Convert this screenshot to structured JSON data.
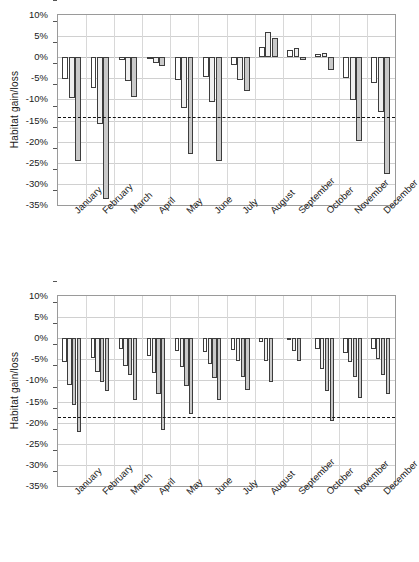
{
  "figure": {
    "panels": [
      "top",
      "bottom"
    ]
  },
  "chart_data": [
    {
      "type": "bar",
      "panel": "top",
      "title": "",
      "xlabel": "",
      "ylabel": "Habitat gain/loss",
      "ylim": [
        -35,
        10
      ],
      "ytick_labels": [
        "10%",
        "5%",
        "0%",
        "-5%",
        "-10%",
        "-15%",
        "-20%",
        "-25%",
        "-30%",
        "-35%"
      ],
      "ytick_values": [
        10,
        5,
        0,
        -5,
        -10,
        -15,
        -20,
        -25,
        -30,
        -35
      ],
      "grid": true,
      "legend": "none",
      "categories": [
        "January",
        "February",
        "March",
        "April",
        "May",
        "June",
        "July",
        "August",
        "September",
        "October",
        "November",
        "December"
      ],
      "series": [
        {
          "name": "series-1",
          "fill": "#ffffff",
          "values": [
            -5.1,
            -7.2,
            -0.6,
            -0.2,
            -5.4,
            -4.8,
            -1.8,
            2.5,
            1.8,
            0.8,
            -5.0,
            -6.1
          ]
        },
        {
          "name": "series-2",
          "fill": "#efefef",
          "values": [
            -9.6,
            -15.7,
            -5.6,
            -1.4,
            -12.1,
            -10.5,
            -5.3,
            6.0,
            2.1,
            0.9,
            -10.1,
            -13.0
          ]
        },
        {
          "name": "series-3",
          "fill": "#c9c9c9",
          "values": [
            -24.5,
            -33.6,
            -9.5,
            -2.0,
            -23.0,
            -24.6,
            -8.0,
            4.6,
            -0.6,
            -3.1,
            -19.8,
            -27.6
          ]
        }
      ],
      "reference_line": {
        "label": "mean",
        "value": -14.2,
        "style": "dashed",
        "color": "#111111"
      }
    },
    {
      "type": "bar",
      "panel": "bottom",
      "title": "",
      "xlabel": "",
      "ylabel": "Habitat gain/loss",
      "ylim": [
        -35,
        10
      ],
      "ytick_labels": [
        "10%",
        "5%",
        "0%",
        "-5%",
        "-10%",
        "-15%",
        "-20%",
        "-25%",
        "-30%",
        "-35%"
      ],
      "ytick_values": [
        10,
        5,
        0,
        -5,
        -10,
        -15,
        -20,
        -25,
        -30,
        -35
      ],
      "grid": true,
      "legend": "none",
      "categories": [
        "January",
        "February",
        "March",
        "April",
        "May",
        "June",
        "July",
        "August",
        "September",
        "October",
        "November",
        "December"
      ],
      "series": [
        {
          "name": "series-1",
          "fill": "#ffffff",
          "values": [
            -5.7,
            -4.8,
            -2.5,
            -4.1,
            -3.1,
            -3.3,
            -2.8,
            -0.9,
            -0.2,
            -2.6,
            -3.5,
            -2.6
          ]
        },
        {
          "name": "series-2",
          "fill": "#efefef",
          "values": [
            -11.0,
            -7.9,
            -6.6,
            -8.2,
            -6.7,
            -6.1,
            -5.5,
            -5.3,
            -3.0,
            -7.4,
            -5.6,
            -4.9
          ]
        },
        {
          "name": "series-3",
          "fill": "#c9c9c9",
          "values": [
            -15.9,
            -10.4,
            -8.8,
            -13.2,
            -11.4,
            -9.4,
            -9.1,
            -10.3,
            -5.5,
            -12.6,
            -9.3,
            -8.7
          ]
        },
        {
          "name": "series-4",
          "fill": "#c9c9c9",
          "values": [
            -22.2,
            -12.6,
            -14.7,
            -21.8,
            -18.0,
            -14.6,
            -12.3,
            null,
            null,
            -19.7,
            -14.2,
            -13.2
          ]
        }
      ],
      "reference_line": {
        "label": "mean",
        "value": -18.6,
        "style": "dashed",
        "color": "#111111"
      }
    }
  ]
}
